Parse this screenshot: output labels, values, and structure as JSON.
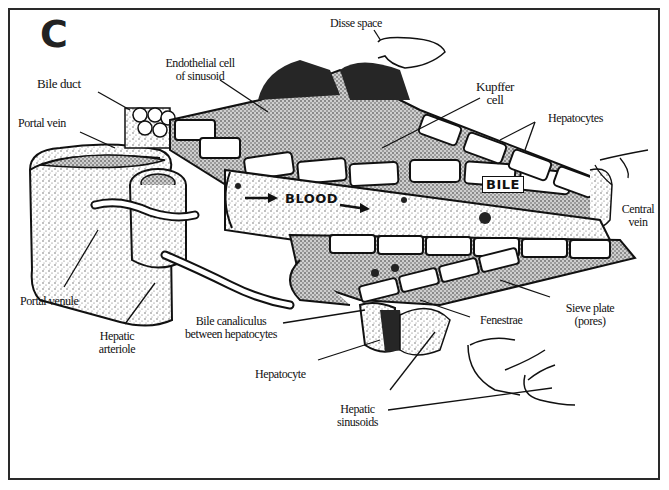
{
  "figure": {
    "panel_letter": "C"
  },
  "labels": {
    "disse_space": "Disse space",
    "endothelial_1": "Endothelial cell",
    "endothelial_2": "of sinusoid",
    "bile_duct": "Bile duct",
    "portal_vein": "Portal vein",
    "kupffer_1": "Kupffer",
    "kupffer_2": "cell",
    "hepatocytes": "Hepatocytes",
    "central_1": "Central",
    "central_2": "vein",
    "portal_venule": "Portal venule",
    "hepatic_arteriole_1": "Hepatic",
    "hepatic_arteriole_2": "arteriole",
    "bile_canaliculus_1": "Bile canaliculus",
    "bile_canaliculus_2": "between hepatocytes",
    "hepatocyte": "Hepatocyte",
    "fenestrae": "Fenestrae",
    "sieve_1": "Sieve plate",
    "sieve_2": "(pores)",
    "hepatic_sinusoids_1": "Hepatic",
    "hepatic_sinusoids_2": "sinusoids"
  },
  "inline_labels": {
    "blood": "BLOOD",
    "bile": "BILE"
  },
  "colors": {
    "ink": "#111111",
    "stipple": "#8a8a8a",
    "dark_fill": "#262626",
    "paper": "#ffffff"
  }
}
